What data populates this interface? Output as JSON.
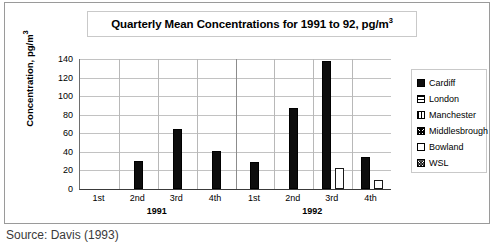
{
  "figure": {
    "title": "Quarterly Mean Concentrations for 1991 to 92, pg/m",
    "title_superscript": "3",
    "source_note": "Source: Davis (1993)"
  },
  "axes": {
    "y_title": "Concentration, pg/m",
    "y_title_superscript": "3",
    "y_ticks": [
      "140",
      "120",
      "100",
      "80",
      "60",
      "40",
      "20",
      "0"
    ],
    "x_tick_labels": [
      "1st",
      "2nd",
      "3rd",
      "4th",
      "1st",
      "2nd",
      "3rd",
      "4th"
    ],
    "year_labels": [
      "1991",
      "1992"
    ]
  },
  "legend": {
    "items": [
      {
        "label": "Cardiff",
        "swatch": "solid-black",
        "color": "#0d0d0d"
      },
      {
        "label": "London",
        "swatch": "horizontal-lines",
        "color": "#000000"
      },
      {
        "label": "Manchester",
        "swatch": "vertical-lines",
        "color": "#000000"
      },
      {
        "label": "Middlesbrough",
        "swatch": "dense-crosshatch",
        "color": "#000000"
      },
      {
        "label": "Bowland",
        "swatch": "empty-white",
        "color": "#ffffff"
      },
      {
        "label": "WSL",
        "swatch": "light-dots",
        "color": "#555555"
      }
    ]
  },
  "chart_data": {
    "type": "bar",
    "xlabel": "",
    "ylabel": "Concentration, pg/m³",
    "ylim": [
      0,
      140
    ],
    "ytick_step": 20,
    "grid": true,
    "legend_position": "right",
    "categories": [
      "1st",
      "2nd",
      "3rd",
      "4th",
      "1st",
      "2nd",
      "3rd",
      "4th"
    ],
    "category_groups": [
      {
        "year": "1991",
        "quarters": [
          "1st",
          "2nd",
          "3rd",
          "4th"
        ]
      },
      {
        "year": "1992",
        "quarters": [
          "1st",
          "2nd",
          "3rd",
          "4th"
        ]
      }
    ],
    "series": [
      {
        "name": "Cardiff",
        "values": [
          null,
          30,
          65,
          41,
          29,
          87,
          138,
          35
        ]
      },
      {
        "name": "London",
        "values": [
          null,
          null,
          null,
          null,
          null,
          null,
          null,
          null
        ]
      },
      {
        "name": "Manchester",
        "values": [
          null,
          null,
          null,
          null,
          null,
          null,
          null,
          null
        ]
      },
      {
        "name": "Middlesbrough",
        "values": [
          null,
          null,
          null,
          null,
          null,
          null,
          null,
          null
        ]
      },
      {
        "name": "Bowland",
        "values": [
          null,
          null,
          null,
          null,
          null,
          null,
          23,
          10
        ]
      },
      {
        "name": "WSL",
        "values": [
          null,
          null,
          null,
          null,
          null,
          null,
          null,
          null
        ]
      }
    ]
  }
}
